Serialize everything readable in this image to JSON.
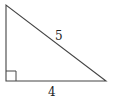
{
  "diagram": {
    "type": "right-triangle",
    "vertices": {
      "top": [
        6,
        5
      ],
      "right_angle": [
        6,
        81
      ],
      "right": [
        106,
        81
      ]
    },
    "right_angle_marker_size": 10,
    "labels": {
      "hypotenuse": "5",
      "base": "4"
    },
    "stroke_color": "#444444"
  }
}
